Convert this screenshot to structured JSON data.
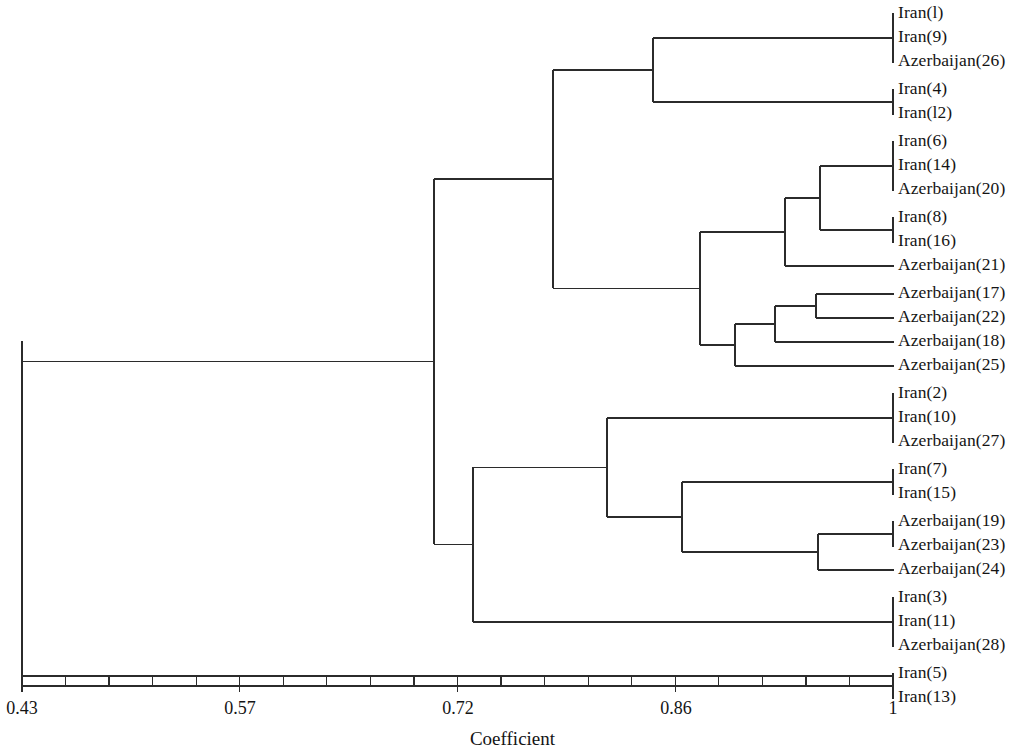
{
  "figure": {
    "type": "dendrogram",
    "axis_title": "Coefficient",
    "line_color": "#2b2b2b",
    "background": "#ffffff"
  },
  "axis": {
    "title": "Coefficient",
    "min": 0.43,
    "max": 1,
    "labeled_ticks": [
      {
        "value": 0.43,
        "label": "0.43",
        "x": 22
      },
      {
        "value": 0.57,
        "label": "0.57",
        "x": 240
      },
      {
        "value": 0.72,
        "label": "0.72",
        "x": 458
      },
      {
        "value": 0.86,
        "label": "0.86",
        "x": 676
      },
      {
        "value": 1.0,
        "label": "1",
        "x": 893
      }
    ],
    "minor_tick_count": 21,
    "axis_y": 676,
    "left_px": 22,
    "right_px": 893
  },
  "chart_data": {
    "type": "dendrogram",
    "title": "",
    "xlabel": "Coefficient",
    "ylabel": "",
    "xlim": [
      0.43,
      1.0
    ],
    "grid": false,
    "legend": "none",
    "leaves": [
      {
        "index": 0,
        "label": "Iran(l)",
        "taxon": "Iran",
        "number": 1,
        "y": 14
      },
      {
        "index": 1,
        "label": "Iran(9)",
        "taxon": "Iran",
        "number": 9,
        "y": 38
      },
      {
        "index": 2,
        "label": "Azerbaijan(26)",
        "taxon": "Azerbaijan",
        "number": 26,
        "y": 62
      },
      {
        "index": 3,
        "label": "Iran(4)",
        "taxon": "Iran",
        "number": 4,
        "y": 90
      },
      {
        "index": 4,
        "label": "Iran(l2)",
        "taxon": "Iran",
        "number": 12,
        "y": 114
      },
      {
        "index": 5,
        "label": "Iran(6)",
        "taxon": "Iran",
        "number": 6,
        "y": 142
      },
      {
        "index": 6,
        "label": "Iran(14)",
        "taxon": "Iran",
        "number": 14,
        "y": 166
      },
      {
        "index": 7,
        "label": "Azerbaijan(20)",
        "taxon": "Azerbaijan",
        "number": 20,
        "y": 190
      },
      {
        "index": 8,
        "label": "Iran(8)",
        "taxon": "Iran",
        "number": 8,
        "y": 218
      },
      {
        "index": 9,
        "label": "Iran(16)",
        "taxon": "Iran",
        "number": 16,
        "y": 242
      },
      {
        "index": 10,
        "label": "Azerbaijan(21)",
        "taxon": "Azerbaijan",
        "number": 21,
        "y": 266
      },
      {
        "index": 11,
        "label": "Azerbaijan(17)",
        "taxon": "Azerbaijan",
        "number": 17,
        "y": 294
      },
      {
        "index": 12,
        "label": "Azerbaijan(22)",
        "taxon": "Azerbaijan",
        "number": 22,
        "y": 318
      },
      {
        "index": 13,
        "label": "Azerbaijan(18)",
        "taxon": "Azerbaijan",
        "number": 18,
        "y": 342
      },
      {
        "index": 14,
        "label": "Azerbaijan(25)",
        "taxon": "Azerbaijan",
        "number": 25,
        "y": 366
      },
      {
        "index": 15,
        "label": "Iran(2)",
        "taxon": "Iran",
        "number": 2,
        "y": 394
      },
      {
        "index": 16,
        "label": "Iran(10)",
        "taxon": "Iran",
        "number": 10,
        "y": 418
      },
      {
        "index": 17,
        "label": "Azerbaijan(27)",
        "taxon": "Azerbaijan",
        "number": 27,
        "y": 442
      },
      {
        "index": 18,
        "label": "Iran(7)",
        "taxon": "Iran",
        "number": 7,
        "y": 470
      },
      {
        "index": 19,
        "label": "Iran(15)",
        "taxon": "Iran",
        "number": 15,
        "y": 494
      },
      {
        "index": 20,
        "label": "Azerbaijan(19)",
        "taxon": "Azerbaijan",
        "number": 19,
        "y": 522
      },
      {
        "index": 21,
        "label": "Azerbaijan(23)",
        "taxon": "Azerbaijan",
        "number": 23,
        "y": 546
      },
      {
        "index": 22,
        "label": "Azerbaijan(24)",
        "taxon": "Azerbaijan",
        "number": 24,
        "y": 570
      },
      {
        "index": 23,
        "label": "Iran(3)",
        "taxon": "Iran",
        "number": 3,
        "y": 598
      },
      {
        "index": 24,
        "label": "Iran(11)",
        "taxon": "Iran",
        "number": 11,
        "y": 622
      },
      {
        "index": 25,
        "label": "Azerbaijan(28)",
        "taxon": "Azerbaijan",
        "number": 28,
        "y": 646
      },
      {
        "index": 26,
        "label": "Iran(5)",
        "taxon": "Iran",
        "number": 5,
        "y": 674
      },
      {
        "index": 27,
        "label": "Iran(13)",
        "taxon": "Iran",
        "number": 13,
        "y": 698
      }
    ],
    "merges": [
      {
        "id": "n1",
        "x": 893,
        "coefficient": 1.0,
        "y_top": 14,
        "y_bottom": 62,
        "members": [
          "Iran(l)",
          "Iran(9)",
          "Azerbaijan(26)"
        ]
      },
      {
        "id": "n2",
        "x": 893,
        "coefficient": 1.0,
        "y_top": 90,
        "y_bottom": 114,
        "members": [
          "Iran(4)",
          "Iran(l2)"
        ]
      },
      {
        "id": "n3",
        "x": 653,
        "coefficient": 0.862,
        "y_top": 38,
        "y_bottom": 102,
        "members": [
          "n1",
          "n2"
        ]
      },
      {
        "id": "n4",
        "x": 893,
        "coefficient": 1.0,
        "y_top": 142,
        "y_bottom": 190,
        "members": [
          "Iran(6)",
          "Iran(14)",
          "Azerbaijan(20)"
        ]
      },
      {
        "id": "n5",
        "x": 893,
        "coefficient": 1.0,
        "y_top": 218,
        "y_bottom": 242,
        "members": [
          "Iran(8)",
          "Iran(16)"
        ]
      },
      {
        "id": "n6",
        "x": 820,
        "coefficient": 0.953,
        "y_top": 166,
        "y_bottom": 230,
        "members": [
          "n4",
          "n5"
        ]
      },
      {
        "id": "n7",
        "x": 785,
        "coefficient": 0.93,
        "y_top": 198,
        "y_bottom": 266,
        "members": [
          "n6",
          "Azerbaijan(21)"
        ]
      },
      {
        "id": "n8",
        "x": 816,
        "coefficient": 0.95,
        "y_top": 294,
        "y_bottom": 318,
        "members": [
          "Azerbaijan(17)",
          "Azerbaijan(22)"
        ]
      },
      {
        "id": "n9",
        "x": 775,
        "coefficient": 0.923,
        "y_top": 306,
        "y_bottom": 342,
        "members": [
          "n8",
          "Azerbaijan(18)"
        ]
      },
      {
        "id": "n10",
        "x": 735,
        "coefficient": 0.897,
        "y_top": 324,
        "y_bottom": 366,
        "members": [
          "n9",
          "Azerbaijan(25)"
        ]
      },
      {
        "id": "n11",
        "x": 700,
        "coefficient": 0.875,
        "y_top": 232,
        "y_bottom": 345,
        "members": [
          "n7",
          "n10"
        ]
      },
      {
        "id": "n12",
        "x": 553,
        "coefficient": 0.78,
        "y_top": 70,
        "y_bottom": 288,
        "members": [
          "n3",
          "n11"
        ]
      },
      {
        "id": "n13",
        "x": 893,
        "coefficient": 1.0,
        "y_top": 394,
        "y_bottom": 442,
        "members": [
          "Iran(2)",
          "Iran(10)",
          "Azerbaijan(27)"
        ]
      },
      {
        "id": "n14",
        "x": 893,
        "coefficient": 1.0,
        "y_top": 470,
        "y_bottom": 494,
        "members": [
          "Iran(7)",
          "Iran(15)"
        ]
      },
      {
        "id": "n15",
        "x": 893,
        "coefficient": 1.0,
        "y_top": 522,
        "y_bottom": 546,
        "members": [
          "Azerbaijan(19)",
          "Azerbaijan(23)"
        ]
      },
      {
        "id": "n16",
        "x": 818,
        "coefficient": 0.951,
        "y_top": 534,
        "y_bottom": 570,
        "members": [
          "n15",
          "Azerbaijan(24)"
        ]
      },
      {
        "id": "n17",
        "x": 682,
        "coefficient": 0.863,
        "y_top": 482,
        "y_bottom": 552,
        "members": [
          "n14",
          "n16"
        ]
      },
      {
        "id": "n18",
        "x": 607,
        "coefficient": 0.815,
        "y_top": 418,
        "y_bottom": 517,
        "members": [
          "n13",
          "n17"
        ]
      },
      {
        "id": "n19",
        "x": 893,
        "coefficient": 1.0,
        "y_top": 598,
        "y_bottom": 646,
        "members": [
          "Iran(3)",
          "Iran(11)",
          "Azerbaijan(28)"
        ]
      },
      {
        "id": "n20",
        "x": 473,
        "coefficient": 0.729,
        "y_top": 467,
        "y_bottom": 622,
        "members": [
          "n18",
          "n19"
        ]
      },
      {
        "id": "n21",
        "x": 893,
        "coefficient": 1.0,
        "y_top": 674,
        "y_bottom": 698,
        "members": [
          "Iran(5)",
          "Iran(13)"
        ]
      },
      {
        "id": "n22",
        "x": 434,
        "coefficient": 0.704,
        "y_top": 179,
        "y_bottom": 544,
        "members": [
          "n12",
          "n20"
        ]
      },
      {
        "id": "n23",
        "x": 22,
        "coefficient": 0.43,
        "y_top": 341,
        "y_bottom": 686,
        "members": [
          "n22",
          "n21"
        ]
      }
    ]
  },
  "leaf_labels": [
    "Iran(l)",
    "Iran(9)",
    "Azerbaijan(26)",
    "Iran(4)",
    "Iran(l2)",
    "Iran(6)",
    "Iran(14)",
    "Azerbaijan(20)",
    "Iran(8)",
    "Iran(16)",
    "Azerbaijan(21)",
    "Azerbaijan(17)",
    "Azerbaijan(22)",
    "Azerbaijan(18)",
    "Azerbaijan(25)",
    "Iran(2)",
    "Iran(10)",
    "Azerbaijan(27)",
    "Iran(7)",
    "Iran(15)",
    "Azerbaijan(19)",
    "Azerbaijan(23)",
    "Azerbaijan(24)",
    "Iran(3)",
    "Iran(11)",
    "Azerbaijan(28)",
    "Iran(5)",
    "Iran(13)"
  ]
}
